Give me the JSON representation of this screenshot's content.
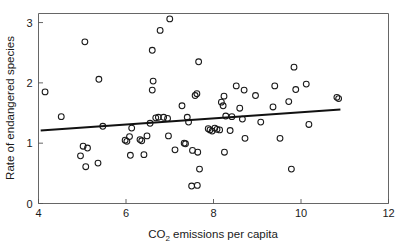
{
  "chart_data": {
    "type": "scatter",
    "title": "",
    "xlabel": "CO2 emissions per capita",
    "xlabel_parts": {
      "main_pre": "CO",
      "sub": "2",
      "main_post": " emissions per capita"
    },
    "ylabel": "Rate of endangered species",
    "xlim": [
      4,
      12
    ],
    "ylim": [
      0,
      3.15
    ],
    "xticks": [
      4,
      6,
      8,
      10,
      12
    ],
    "xtick_labels": [
      "4",
      "6",
      "8",
      "10",
      "12"
    ],
    "yticks": [
      0,
      1,
      2,
      3
    ],
    "ytick_labels": [
      "0",
      "1",
      "2",
      "3"
    ],
    "grid": false,
    "legend": false,
    "marker": "open-circle",
    "marker_color": "#1a1a1a",
    "frame_color": "#555555",
    "fit_line": {
      "label": "linear regression fit",
      "color": "#111111",
      "x_start": 4.05,
      "y_start": 1.21,
      "x_end": 10.9,
      "y_end": 1.56,
      "slope": 0.051,
      "intercept": 1.004
    },
    "points": [
      [
        4.15,
        1.85
      ],
      [
        4.52,
        1.44
      ],
      [
        5.06,
        2.68
      ],
      [
        5.38,
        2.06
      ],
      [
        5.47,
        1.28
      ],
      [
        5.02,
        0.95
      ],
      [
        5.12,
        0.92
      ],
      [
        4.96,
        0.79
      ],
      [
        5.08,
        0.61
      ],
      [
        5.36,
        0.67
      ],
      [
        5.98,
        1.05
      ],
      [
        6.02,
        1.03
      ],
      [
        6.08,
        1.11
      ],
      [
        6.13,
        1.25
      ],
      [
        6.1,
        0.8
      ],
      [
        6.32,
        1.06
      ],
      [
        6.36,
        1.04
      ],
      [
        6.41,
        0.81
      ],
      [
        6.48,
        1.12
      ],
      [
        6.55,
        1.33
      ],
      [
        6.6,
        2.54
      ],
      [
        6.62,
        2.03
      ],
      [
        6.6,
        1.88
      ],
      [
        6.68,
        1.42
      ],
      [
        6.74,
        1.43
      ],
      [
        6.78,
        2.87
      ],
      [
        6.86,
        1.43
      ],
      [
        6.95,
        1.41
      ],
      [
        7.0,
        3.06
      ],
      [
        6.97,
        1.12
      ],
      [
        7.12,
        0.89
      ],
      [
        7.28,
        1.62
      ],
      [
        7.33,
        1.0
      ],
      [
        7.36,
        0.99
      ],
      [
        7.4,
        1.43
      ],
      [
        7.43,
        1.35
      ],
      [
        7.5,
        0.29
      ],
      [
        7.52,
        0.88
      ],
      [
        7.58,
        1.79
      ],
      [
        7.62,
        1.82
      ],
      [
        7.66,
        2.35
      ],
      [
        7.63,
        0.3
      ],
      [
        7.64,
        0.85
      ],
      [
        7.68,
        0.57
      ],
      [
        7.88,
        1.24
      ],
      [
        7.92,
        1.22
      ],
      [
        7.97,
        1.2
      ],
      [
        8.03,
        1.25
      ],
      [
        8.08,
        1.23
      ],
      [
        8.14,
        1.22
      ],
      [
        8.18,
        1.68
      ],
      [
        8.24,
        1.78
      ],
      [
        8.22,
        1.62
      ],
      [
        8.28,
        1.45
      ],
      [
        8.25,
        0.85
      ],
      [
        8.42,
        1.44
      ],
      [
        8.38,
        1.21
      ],
      [
        8.52,
        1.95
      ],
      [
        8.6,
        1.58
      ],
      [
        8.66,
        1.4
      ],
      [
        8.7,
        1.88
      ],
      [
        8.72,
        1.08
      ],
      [
        8.96,
        1.79
      ],
      [
        9.08,
        1.35
      ],
      [
        9.36,
        1.6
      ],
      [
        9.4,
        1.95
      ],
      [
        9.52,
        1.08
      ],
      [
        9.72,
        1.69
      ],
      [
        9.78,
        0.57
      ],
      [
        9.84,
        2.26
      ],
      [
        9.88,
        1.89
      ],
      [
        10.12,
        1.98
      ],
      [
        10.18,
        1.31
      ],
      [
        10.82,
        1.76
      ],
      [
        10.86,
        1.74
      ]
    ]
  }
}
